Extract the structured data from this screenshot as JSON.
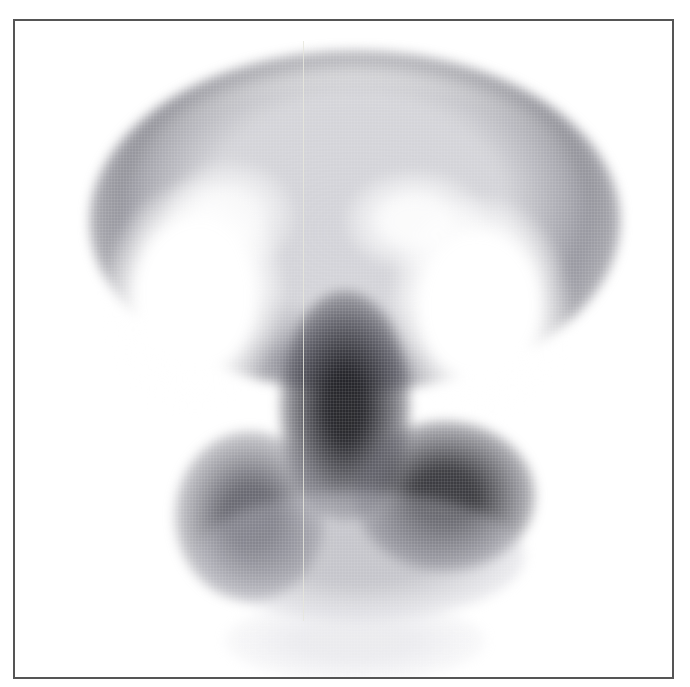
{
  "figure": {
    "type": "nuclear-medicine-scan",
    "frame_color": "#555555",
    "background": "#ffffff",
    "tracer_color": "#2a2a2a"
  }
}
